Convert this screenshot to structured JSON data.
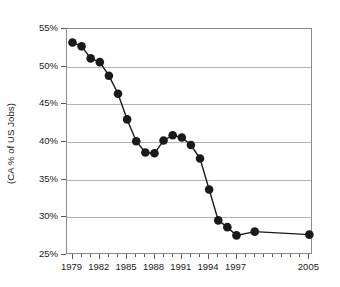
{
  "chart_data": {
    "type": "line",
    "title": "",
    "subtitle": "",
    "xlabel": "",
    "ylabel": "(CA % of US Jobs)",
    "x": [
      1979,
      1980,
      1981,
      1982,
      1983,
      1984,
      1985,
      1986,
      1987,
      1988,
      1989,
      1990,
      1991,
      1992,
      1993,
      1994,
      1995,
      1996,
      1997,
      1999,
      2005
    ],
    "values": [
      53.2,
      52.7,
      51.1,
      50.6,
      48.8,
      46.4,
      43.0,
      40.1,
      38.6,
      38.5,
      40.2,
      40.9,
      40.6,
      39.6,
      37.8,
      33.7,
      29.6,
      28.7,
      27.6,
      28.1,
      27.7
    ],
    "series": [
      {
        "name": "CA % of US Jobs",
        "values": [
          53.2,
          52.7,
          51.1,
          50.6,
          48.8,
          46.4,
          43.0,
          40.1,
          38.6,
          38.5,
          40.2,
          40.9,
          40.6,
          39.6,
          37.8,
          33.7,
          29.6,
          28.7,
          27.6,
          28.1,
          27.7
        ]
      }
    ],
    "xlim": [
      1978.4,
      2005.4
    ],
    "ylim": [
      25,
      55
    ],
    "ytick_labels": [
      "55%",
      "50%",
      "45%",
      "40%",
      "35%",
      "30%",
      "25%"
    ],
    "ytick_values": [
      55,
      50,
      45,
      40,
      35,
      30,
      25
    ],
    "xtick_labels": [
      "1979",
      "1982",
      "1985",
      "1988",
      "1991",
      "1994",
      "1997",
      "2005"
    ],
    "xtick_label_values": [
      1979,
      1982,
      1985,
      1988,
      1991,
      1994,
      1997,
      2005
    ],
    "xtick_values": [
      1979,
      1980,
      1981,
      1982,
      1983,
      1984,
      1985,
      1986,
      1987,
      1988,
      1989,
      1990,
      1991,
      1992,
      1993,
      1994,
      1995,
      1996,
      1997,
      1998,
      1999,
      2000,
      2001,
      2002,
      2003,
      2004,
      2005
    ],
    "grid": true,
    "grid_axis": "y",
    "legend": false,
    "legend_position": "none",
    "marker": "filled-circle",
    "line_color": "#1a1a1a",
    "marker_color": "#1a1a1a",
    "grid_color": "#b4b4b4",
    "frame_color": "#8a8a8a",
    "background_color": "#ffffff"
  }
}
